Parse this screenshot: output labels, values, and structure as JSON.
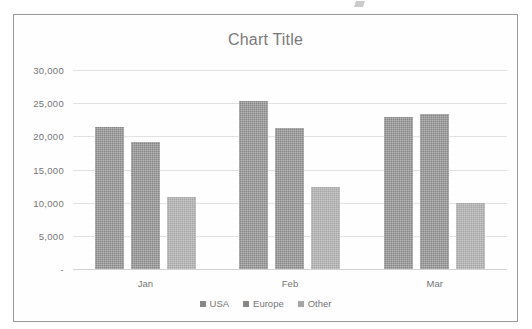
{
  "chart_data": {
    "type": "bar",
    "title": "Chart Title",
    "xlabel": "",
    "ylabel": "",
    "categories": [
      "Jan",
      "Feb",
      "Mar"
    ],
    "series": [
      {
        "name": "USA",
        "values": [
          21400,
          25400,
          22900
        ],
        "color": "#878787"
      },
      {
        "name": "Europe",
        "values": [
          19100,
          21300,
          23400
        ],
        "color": "#878787"
      },
      {
        "name": "Other",
        "values": [
          10900,
          12300,
          9900
        ],
        "color": "#a5a5a5"
      }
    ],
    "ylim": [
      0,
      30000
    ],
    "ytick_values": [
      30000,
      25000,
      20000,
      15000,
      10000,
      5000,
      0
    ],
    "ytick_labels": [
      "30,000",
      "25,000",
      "20,000",
      "15,000",
      "10,000",
      "5,000",
      "-"
    ],
    "grid": true,
    "legend_position": "bottom"
  },
  "chart": {
    "title": "Chart Title",
    "yticks": [
      {
        "label": "30,000",
        "value": 30000
      },
      {
        "label": "25,000",
        "value": 25000
      },
      {
        "label": "20,000",
        "value": 20000
      },
      {
        "label": "15,000",
        "value": 15000
      },
      {
        "label": "10,000",
        "value": 10000
      },
      {
        "label": "5,000",
        "value": 5000
      },
      {
        "label": "-",
        "value": 0
      }
    ],
    "groups": [
      {
        "label": "Jan",
        "bars": [
          {
            "series": "USA",
            "value": 21400
          },
          {
            "series": "Europe",
            "value": 19100
          },
          {
            "series": "Other",
            "value": 10900
          }
        ]
      },
      {
        "label": "Feb",
        "bars": [
          {
            "series": "USA",
            "value": 25400
          },
          {
            "series": "Europe",
            "value": 21300
          },
          {
            "series": "Other",
            "value": 12300
          }
        ]
      },
      {
        "label": "Mar",
        "bars": [
          {
            "series": "USA",
            "value": 22900
          },
          {
            "series": "Europe",
            "value": 23400
          },
          {
            "series": "Other",
            "value": 9900
          }
        ]
      }
    ],
    "legend": [
      {
        "label": "USA",
        "color": "#878787"
      },
      {
        "label": "Europe",
        "color": "#878787"
      },
      {
        "label": "Other",
        "color": "#a5a5a5"
      }
    ]
  }
}
